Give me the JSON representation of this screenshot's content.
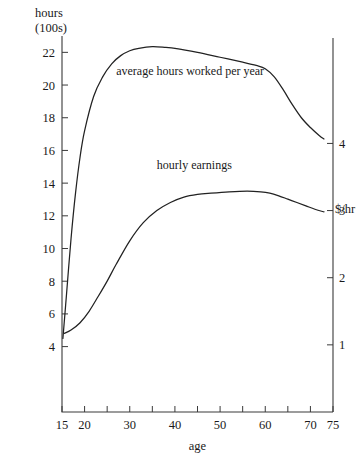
{
  "chart_data": {
    "type": "line",
    "title": "",
    "xlabel": "age",
    "xlim": [
      15,
      75
    ],
    "x_ticks_labeled": [
      15,
      20,
      30,
      40,
      50,
      60,
      70,
      75
    ],
    "x_ticks_minor": [
      25,
      35,
      45,
      55,
      65
    ],
    "grid": false,
    "legend": "inline-labels",
    "axes": [
      {
        "id": "left",
        "title_line1": "hours",
        "title_line2": "(100s)",
        "ylim": [
          0,
          23
        ],
        "ticks": [
          4,
          6,
          8,
          10,
          12,
          14,
          16,
          18,
          20,
          22
        ]
      },
      {
        "id": "right",
        "title": "$/hr",
        "ylim": [
          0,
          5.6
        ],
        "ticks": [
          1,
          2,
          3,
          4
        ]
      }
    ],
    "series": [
      {
        "name": "average hours worked per year",
        "axis": "left",
        "label": "average hours worked per year",
        "label_x": 27,
        "label_y": 20.6,
        "x": [
          15.2,
          16,
          17,
          18,
          19,
          20,
          22,
          24,
          26,
          28,
          30,
          32,
          35,
          38,
          40,
          45,
          50,
          55,
          58,
          60,
          62,
          64,
          66,
          68,
          70,
          72,
          73
        ],
        "y": [
          4.5,
          7.2,
          10.6,
          13.4,
          15.6,
          17.2,
          19.3,
          20.5,
          21.3,
          21.8,
          22.1,
          22.25,
          22.35,
          22.3,
          22.25,
          22.0,
          21.7,
          21.4,
          21.2,
          21.0,
          20.5,
          19.7,
          18.8,
          18.0,
          17.4,
          16.9,
          16.7
        ]
      },
      {
        "name": "hourly earnings",
        "axis": "right",
        "label": "hourly earnings",
        "label_x": 36,
        "label_y": 3.62,
        "x": [
          15.5,
          17,
          19,
          21,
          23,
          25,
          27,
          30,
          33,
          36,
          39,
          42,
          45,
          48,
          52,
          56,
          59,
          61,
          63,
          65,
          67,
          69,
          71,
          73
        ],
        "y": [
          1.17,
          1.22,
          1.33,
          1.5,
          1.72,
          1.95,
          2.2,
          2.55,
          2.82,
          3.0,
          3.12,
          3.2,
          3.24,
          3.26,
          3.28,
          3.29,
          3.28,
          3.26,
          3.22,
          3.17,
          3.12,
          3.07,
          3.02,
          2.98
        ]
      }
    ]
  },
  "colors": {
    "axis": "#3a3a3a",
    "curve": "#222222",
    "background": "#ffffff"
  }
}
